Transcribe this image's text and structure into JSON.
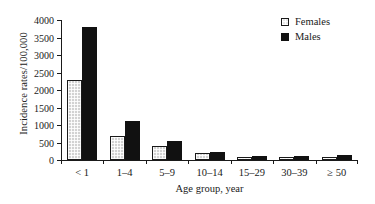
{
  "chart_data": {
    "type": "bar",
    "title": "",
    "xlabel": "Age group, year",
    "ylabel": "Incidence rates/100,000",
    "categories": [
      "< 1",
      "1–4",
      "5–9",
      "10–14",
      "15–29",
      "30–39",
      "≥ 50"
    ],
    "series": [
      {
        "name": "Females",
        "color": "#d2d2d2",
        "values": [
          2300,
          700,
          390,
          200,
          90,
          90,
          80
        ]
      },
      {
        "name": "Males",
        "color": "#111111",
        "values": [
          3800,
          1110,
          550,
          230,
          110,
          110,
          130
        ]
      }
    ],
    "ylim": [
      0,
      4000
    ],
    "yticks": [
      0,
      500,
      1000,
      1500,
      2000,
      2500,
      3000,
      3500,
      4000
    ],
    "ytick_labels": [
      "0",
      "500",
      "1000",
      "1500",
      "2000",
      "2500",
      "3000",
      "3500",
      "4000"
    ],
    "grid": false,
    "legend_position": "top-right",
    "legend": [
      {
        "label": "Females",
        "swatch": "hatched-square"
      },
      {
        "label": "Males",
        "swatch": "filled-square"
      }
    ]
  }
}
